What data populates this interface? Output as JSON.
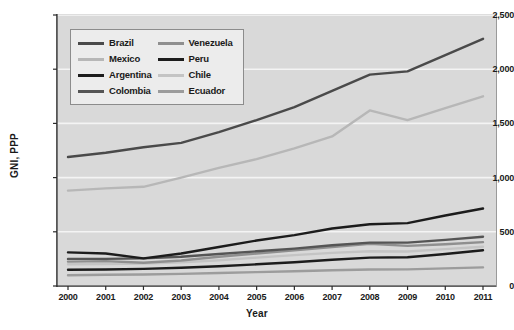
{
  "chart_data": {
    "type": "line",
    "title": "",
    "xlabel": "Year",
    "ylabel": "GNI, PPP",
    "x": [
      2000,
      2001,
      2002,
      2003,
      2004,
      2005,
      2006,
      2007,
      2008,
      2009,
      2010,
      2011
    ],
    "xtick_labels": [
      "2000",
      "2001",
      "2002",
      "2003",
      "2004",
      "2005",
      "2006",
      "2007",
      "2008",
      "2009",
      "2010",
      "2011"
    ],
    "ytick_labels": [
      "0",
      "500",
      "1,000",
      "1,500",
      "2,000",
      "2,500"
    ],
    "ytick_values": [
      0,
      500,
      1000,
      1500,
      2000,
      2500
    ],
    "ylim": [
      0,
      2500
    ],
    "xlim": [
      2000,
      2011
    ],
    "grid": "horizontal",
    "legend_position": "top-left-inside",
    "series": [
      {
        "name": "Brazil",
        "color": "#4a4a4a",
        "values": [
          1190,
          1230,
          1280,
          1320,
          1420,
          1530,
          1650,
          1800,
          1950,
          1980,
          2130,
          2280
        ]
      },
      {
        "name": "Mexico",
        "color": "#b7b7b7",
        "values": [
          880,
          900,
          915,
          1000,
          1090,
          1170,
          1270,
          1380,
          1620,
          1530,
          1640,
          1750
        ]
      },
      {
        "name": "Argentina",
        "color": "#1c1c1c",
        "values": [
          310,
          300,
          255,
          300,
          360,
          420,
          470,
          530,
          570,
          580,
          650,
          715
        ]
      },
      {
        "name": "Colombia",
        "color": "#555555",
        "values": [
          250,
          250,
          255,
          270,
          295,
          320,
          345,
          375,
          400,
          400,
          425,
          455
        ]
      },
      {
        "name": "Venezuela",
        "color": "#8f8f8f",
        "values": [
          225,
          230,
          215,
          235,
          270,
          300,
          330,
          360,
          390,
          370,
          385,
          405
        ]
      },
      {
        "name": "Peru",
        "color": "#1c1c1c",
        "values": [
          150,
          152,
          158,
          168,
          182,
          200,
          220,
          243,
          262,
          265,
          295,
          330
        ]
      },
      {
        "name": "Chile",
        "color": "#c4c4c4",
        "values": [
          200,
          203,
          208,
          218,
          238,
          262,
          285,
          305,
          320,
          318,
          340,
          362
        ]
      },
      {
        "name": "Ecuador",
        "color": "#9c9c9c",
        "values": [
          100,
          103,
          106,
          112,
          120,
          128,
          136,
          145,
          152,
          153,
          162,
          172
        ]
      }
    ]
  },
  "legend": {
    "entries": [
      {
        "label": "Brazil",
        "swatch": "#4a4a4a"
      },
      {
        "label": "Venezuela",
        "swatch": "#8f8f8f"
      },
      {
        "label": "Mexico",
        "swatch": "#b7b7b7"
      },
      {
        "label": "Peru",
        "swatch": "#1c1c1c"
      },
      {
        "label": "Argentina",
        "swatch": "#1c1c1c"
      },
      {
        "label": "Chile",
        "swatch": "#c4c4c4"
      },
      {
        "label": "Colombia",
        "swatch": "#555555"
      },
      {
        "label": "Ecuador",
        "swatch": "#9c9c9c"
      }
    ]
  }
}
